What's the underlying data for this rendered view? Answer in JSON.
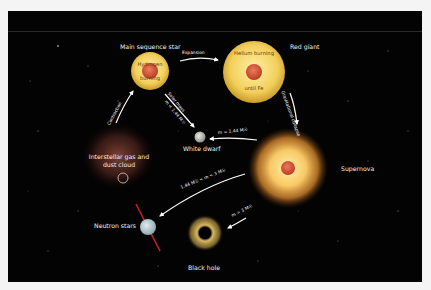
{
  "diagram": {
    "nodes": {
      "main_sequence": {
        "label": "Main sequence star",
        "inner_top": "Hydrogen",
        "inner_bottom": "burning"
      },
      "red_giant": {
        "label": "Red giant",
        "inner_top": "Helium burning",
        "inner_bottom": "until Fe"
      },
      "supernova": {
        "label": "Supernova"
      },
      "white_dwarf": {
        "label": "White dwarf"
      },
      "neutron_stars": {
        "label": "Neutron stars"
      },
      "black_hole": {
        "label": "Black hole"
      },
      "gas_cloud": {
        "label_line1": "Interstellar gas and",
        "label_line2": "dust cloud"
      }
    },
    "arrows": {
      "expansion": "Expansion",
      "gravitational_collapse": "Gravitational collapse",
      "solar_mass": "Solar mass",
      "solar_mass_condition": "m < 1.44 M☉",
      "to_white_dwarf": "m < 1.44 M☉",
      "to_neutron": "1.44 M☉ < m < 3 M☉",
      "to_black_hole": "m > 3 M☉",
      "contraction": "Contraction"
    },
    "colors": {
      "background": "#030303",
      "star_outer": "#f2cf5a",
      "star_core": "#d8573a",
      "white_dwarf": "#c9c9c4",
      "neutron_star": "#b9cfd6",
      "pulsar_beam": "#c0202a",
      "arrow": "#ffffff"
    }
  }
}
